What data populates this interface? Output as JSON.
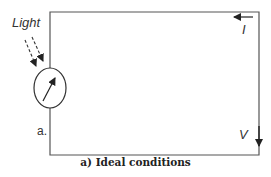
{
  "diagram": {
    "labels": {
      "light": "Light",
      "current": "I",
      "voltage": "V",
      "node_a": "a."
    },
    "caption": "a) Ideal conditions",
    "colors": {
      "line": "#555555",
      "arrow": "#222222",
      "text": "#333333",
      "background": "#ffffff"
    },
    "components": [
      {
        "type": "photodetector-meter",
        "label": "meter with needle"
      },
      {
        "type": "light-rays",
        "count": 2,
        "style": "dashed"
      },
      {
        "type": "current-arrow",
        "direction": "left",
        "label": "I"
      },
      {
        "type": "voltage-arrow",
        "direction": "down",
        "label": "V"
      }
    ]
  }
}
